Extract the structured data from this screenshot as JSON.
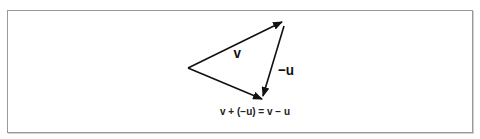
{
  "figure": {
    "labels": {
      "v": "v",
      "neg_u": "−u"
    },
    "equation": "v + (−u) = v − u",
    "colors": {
      "stroke": "#111111",
      "border": "#9a9a9a",
      "background": "#ffffff"
    },
    "vectors": [
      {
        "name": "v",
        "from": [
          188,
          68
        ],
        "to": [
          282,
          22
        ]
      },
      {
        "name": "-u",
        "from": [
          284,
          26
        ],
        "to": [
          263,
          95
        ]
      },
      {
        "name": "v-u",
        "from": [
          188,
          68
        ],
        "to": [
          262,
          99
        ]
      }
    ]
  }
}
